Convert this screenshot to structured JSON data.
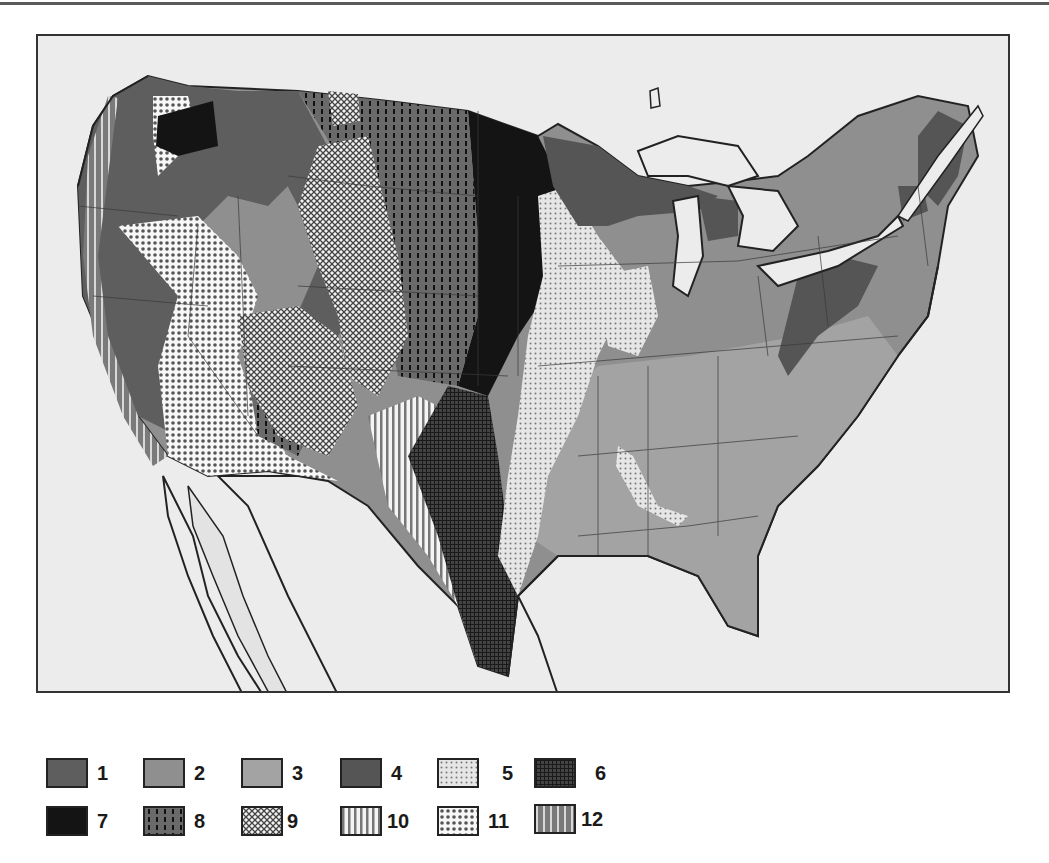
{
  "figure": {
    "type": "thematic-map",
    "region": "Contiguous United States with adjacent Canada and Mexico outlines",
    "rendering": "grayscale with hatch/dot patterns"
  },
  "legend": {
    "items": [
      {
        "id": 1,
        "label": "1",
        "fill": "#5e5e5e",
        "pattern": "solid-dark-gray"
      },
      {
        "id": 2,
        "label": "2",
        "fill": "#8f8f8f",
        "pattern": "solid-medium-gray"
      },
      {
        "id": 3,
        "label": "3",
        "fill": "#a3a3a3",
        "pattern": "solid-light-gray"
      },
      {
        "id": 4,
        "label": "4",
        "fill": "#555555",
        "pattern": "solid-darker-gray"
      },
      {
        "id": 5,
        "label": "5",
        "fill": "#e2e2e2",
        "pattern": "fine-dots"
      },
      {
        "id": 6,
        "label": "6",
        "fill": "#2a2a2a",
        "pattern": "fine-grid-dark"
      },
      {
        "id": 7,
        "label": "7",
        "fill": "#141414",
        "pattern": "solid-black"
      },
      {
        "id": 8,
        "label": "8",
        "fill": "#6a6a6a",
        "pattern": "vertical-dashes"
      },
      {
        "id": 9,
        "label": "9",
        "fill": "#ffffff",
        "pattern": "crosshatch"
      },
      {
        "id": 10,
        "label": "10",
        "fill": "#ffffff",
        "pattern": "vertical-lines-light"
      },
      {
        "id": 11,
        "label": "11",
        "fill": "#ffffff",
        "pattern": "large-dots"
      },
      {
        "id": 12,
        "label": "12",
        "fill": "#7a7a7a",
        "pattern": "vertical-lines-dark"
      }
    ]
  },
  "colors": {
    "background": "#ffffff",
    "water_land_outside": "#ececec",
    "border": "#222222",
    "state_lines": "#3a3a3a"
  }
}
